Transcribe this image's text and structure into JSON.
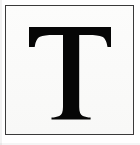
{
  "image": {
    "kind": "scanned-letter-tile",
    "width": 140,
    "height": 145,
    "caption": "T",
    "alt_text": "Black serif capital letter T on a white square with a thin dark border"
  },
  "canvas": {
    "background_color": "#ffffff"
  },
  "frame": {
    "name": "border-rectangle",
    "border_color": "#3a3a3a",
    "border_width_px": 1,
    "fill_color": "#fbfbfa",
    "left_px": 5,
    "top_px": 5,
    "width_px": 129,
    "height_px": 130
  },
  "glyph": {
    "character": "T",
    "letter_case": "uppercase",
    "style": "serif",
    "serif_type": "bracketed",
    "color": "#060606",
    "cap_top_px": 21,
    "baseline_px": 113,
    "top_bar_left_px": 23,
    "top_bar_right_px": 105,
    "stem_left_px": 57,
    "stem_right_px": 73,
    "foot_left_px": 46,
    "foot_right_px": 84
  },
  "shading": {
    "left_edge_color": "rgba(0,0,0,0.05)",
    "bottom_edge_color": "rgba(0,0,0,0.04)"
  }
}
